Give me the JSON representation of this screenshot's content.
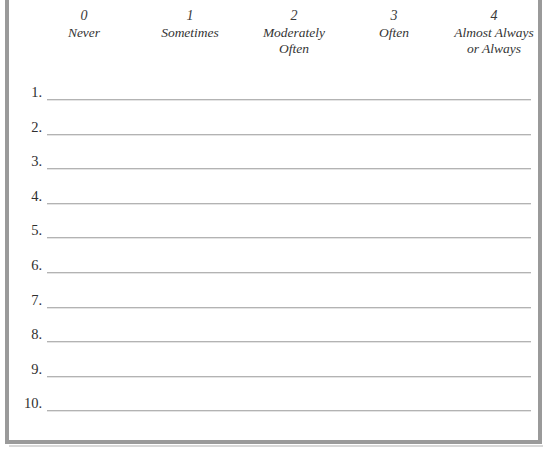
{
  "document": {
    "type": "rating-scale-worksheet",
    "background_color": "#ffffff",
    "frame_color": "#9a9a9a",
    "rule_color": "#b3b3b3"
  },
  "scale": {
    "columns": [
      {
        "value": "0",
        "label": "Never"
      },
      {
        "value": "1",
        "label": "Sometimes"
      },
      {
        "value": "2",
        "label": "Moderately\nOften"
      },
      {
        "value": "3",
        "label": "Often"
      },
      {
        "value": "4",
        "label": "Almost Always\nor Always"
      }
    ]
  },
  "items": [
    {
      "number": "1.",
      "text": ""
    },
    {
      "number": "2.",
      "text": ""
    },
    {
      "number": "3.",
      "text": ""
    },
    {
      "number": "4.",
      "text": ""
    },
    {
      "number": "5.",
      "text": ""
    },
    {
      "number": "6.",
      "text": ""
    },
    {
      "number": "7.",
      "text": ""
    },
    {
      "number": "8.",
      "text": ""
    },
    {
      "number": "9.",
      "text": ""
    },
    {
      "number": "10.",
      "text": ""
    }
  ]
}
